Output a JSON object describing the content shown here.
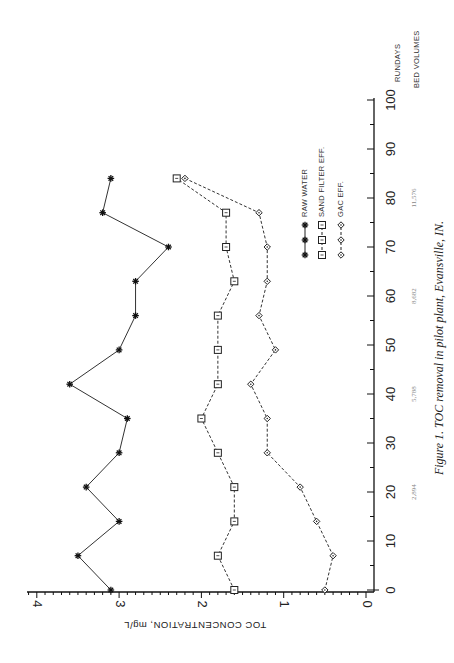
{
  "figure": {
    "caption": "Figure 1. TOC removal in pilot plant, Evansville, IN.",
    "orientation": "rotated 90 degrees clockwise (run days axis vertical, TOC axis horizontal)"
  },
  "axes": {
    "toc_axis_title": "TOC CONCENTRATION, mg/L",
    "toc_ticks": [
      "0",
      "1",
      "2",
      "3",
      "4"
    ],
    "days_axis_title": "RUNDAYS",
    "bed_volumes_title": "BED VOLUMES",
    "days_ticks": [
      "0",
      "10",
      "20",
      "30",
      "40",
      "50",
      "60",
      "70",
      "80",
      "90",
      "100"
    ],
    "bed_volume_labels": [
      {
        "day": 20,
        "label": "2,894"
      },
      {
        "day": 40,
        "label": "5,788"
      },
      {
        "day": 60,
        "label": "8,682"
      },
      {
        "day": 80,
        "label": "11,576"
      }
    ]
  },
  "legend": {
    "items": [
      {
        "label": "RAW WATER",
        "marker": "star"
      },
      {
        "label": "SAND FILTER EFF.",
        "marker": "square"
      },
      {
        "label": "GAC EFF.",
        "marker": "diamond"
      }
    ]
  },
  "chart_data": {
    "type": "line",
    "title": "Figure 1. TOC removal in pilot plant, Evansville, IN.",
    "xlabel": "RUNDAYS (BED VOLUMES)",
    "ylabel": "TOC CONCENTRATION, mg/L",
    "xlim": [
      0,
      100
    ],
    "ylim": [
      0,
      4
    ],
    "grid": false,
    "legend_position": "inside, upper-right (rotated)",
    "secondary_x_labels": {
      "20": "2,894",
      "40": "5,788",
      "60": "8,682",
      "80": "11,576"
    },
    "x": [
      0,
      7,
      14,
      21,
      28,
      35,
      42,
      49,
      56,
      63,
      70,
      77,
      84
    ],
    "series": [
      {
        "name": "RAW WATER",
        "marker": "star",
        "line": "solid",
        "values": [
          3.1,
          3.5,
          3.0,
          3.4,
          3.0,
          2.9,
          3.6,
          3.0,
          2.8,
          2.8,
          2.4,
          3.2,
          3.1
        ]
      },
      {
        "name": "SAND FILTER EFF.",
        "marker": "square",
        "line": "dashed",
        "values": [
          1.6,
          1.8,
          1.6,
          1.6,
          1.8,
          2.0,
          1.8,
          1.8,
          1.8,
          1.6,
          1.7,
          1.7,
          2.3
        ]
      },
      {
        "name": "GAC EFF.",
        "marker": "diamond",
        "line": "dashed",
        "values": [
          0.5,
          0.4,
          0.6,
          0.8,
          1.2,
          1.2,
          1.4,
          1.1,
          1.3,
          1.2,
          1.2,
          1.3,
          2.2
        ]
      }
    ]
  }
}
